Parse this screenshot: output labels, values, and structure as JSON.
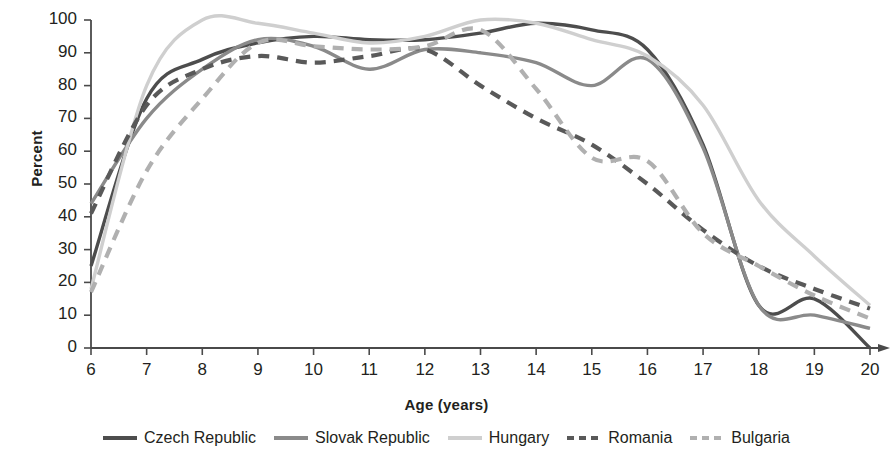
{
  "chart_data": {
    "type": "line",
    "title": "",
    "xlabel": "Age (years)",
    "ylabel": "Percent",
    "xlim": [
      6,
      20
    ],
    "ylim": [
      0,
      100
    ],
    "xticks": [
      "6",
      "7",
      "8",
      "9",
      "10",
      "11",
      "12",
      "13",
      "14",
      "15",
      "16",
      "17",
      "18",
      "19",
      "20"
    ],
    "yticks": [
      "0",
      "10",
      "20",
      "30",
      "40",
      "50",
      "60",
      "70",
      "80",
      "90",
      "100"
    ],
    "grid": false,
    "legend_position": "bottom",
    "x": [
      6,
      7,
      8,
      9,
      10,
      11,
      12,
      13,
      14,
      15,
      16,
      17,
      18,
      19,
      20
    ],
    "series": [
      {
        "name": "Czech Republic",
        "color": "#4d4d4d",
        "style": "solid",
        "values": [
          25,
          76,
          88,
          93,
          95,
          94,
          94,
          96,
          99,
          97,
          91,
          62,
          13,
          15,
          0
        ]
      },
      {
        "name": "Slovak Republic",
        "color": "#8a8a8a",
        "style": "solid",
        "values": [
          44,
          70,
          85,
          94,
          92,
          85,
          91,
          90,
          87,
          80,
          88,
          61,
          13,
          10,
          6
        ]
      },
      {
        "name": "Hungary",
        "color": "#cfcfcf",
        "style": "solid",
        "values": [
          18,
          80,
          100,
          99,
          96,
          93,
          95,
          100,
          99,
          94,
          89,
          74,
          45,
          28,
          13
        ]
      },
      {
        "name": "Romania",
        "color": "#595959",
        "style": "dashed",
        "values": [
          41,
          74,
          85,
          89,
          87,
          89,
          91,
          80,
          70,
          62,
          50,
          36,
          25,
          18,
          12
        ]
      },
      {
        "name": "Bulgaria",
        "color": "#b0b0b0",
        "style": "dashed",
        "values": [
          17,
          54,
          76,
          93,
          92,
          91,
          92,
          97,
          79,
          58,
          57,
          35,
          25,
          16,
          9
        ]
      }
    ]
  },
  "legend": {
    "items": [
      {
        "label": "Czech Republic"
      },
      {
        "label": "Slovak Republic"
      },
      {
        "label": "Hungary"
      },
      {
        "label": "Romania"
      },
      {
        "label": "Bulgaria"
      }
    ]
  },
  "axes": {
    "y_title": "Percent",
    "x_title": "Age (years)"
  }
}
